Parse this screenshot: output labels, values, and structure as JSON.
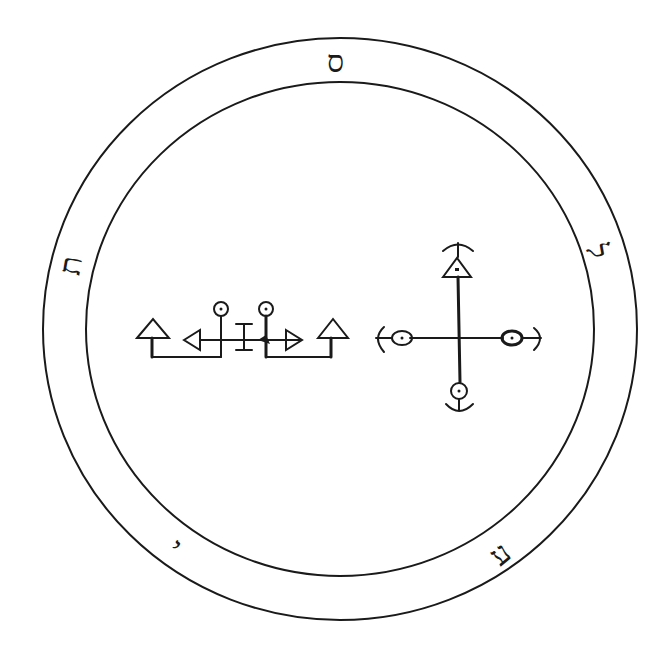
{
  "figure": {
    "ink_color": "#1a1a1a",
    "background": "#ffffff"
  },
  "outer_band_letters": [
    {
      "position": "top",
      "glyph": "ס"
    },
    {
      "position": "right",
      "glyph": "ל"
    },
    {
      "position": "bottom-right",
      "glyph": "ע"
    },
    {
      "position": "bottom-left",
      "glyph": "י"
    },
    {
      "position": "left",
      "glyph": "ת"
    }
  ],
  "sigils": [
    {
      "name": "left-sigil",
      "elements": [
        "triangle",
        "triangle-left",
        "circle-dot",
        "I-bar",
        "circle-dot",
        "triangle-right",
        "triangle"
      ]
    },
    {
      "name": "right-sigil",
      "elements": [
        "cross",
        "triangle-dot-top",
        "circle-dot-left",
        "circle-dot-right",
        "circle-dot-bottom",
        "arcs"
      ]
    }
  ]
}
